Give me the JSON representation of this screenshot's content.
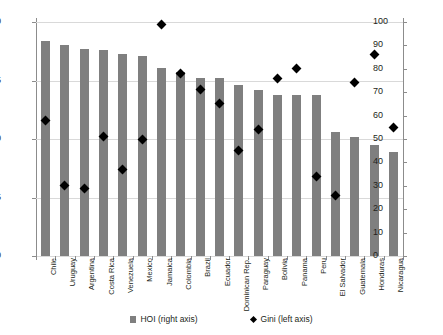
{
  "chart_data": {
    "type": "bar",
    "title": "",
    "xlabel": "",
    "ylabel": "",
    "categories": [
      "Chile",
      "Uruguay",
      "Argentina",
      "Costa Rica",
      "Venezuela",
      "Mexico",
      "Jamaica",
      "Colombia",
      "Brazil",
      "Ecuador",
      "Dominican Rep.",
      "Paraguay",
      "Bolivia",
      "Panama",
      "Peru",
      "El Salvador",
      "Guatemala",
      "Honduras",
      "Nicaragua"
    ],
    "series": [
      {
        "name": "HOI (right axis)",
        "type": "bar",
        "axis": "left",
        "color": "#7f7f7f",
        "marker": "bar",
        "values": [
          0.584,
          0.58,
          0.577,
          0.576,
          0.573,
          0.571,
          0.561,
          0.557,
          0.552,
          0.552,
          0.546,
          0.542,
          0.538,
          0.538,
          0.538,
          0.506,
          0.502,
          0.495,
          0.489
        ]
      },
      {
        "name": "Gini (left axis)",
        "type": "scatter",
        "axis": "right",
        "color": "#000000",
        "marker": "diamond",
        "values": [
          58,
          30,
          29,
          51,
          37,
          50,
          99,
          78,
          71,
          65,
          45,
          54,
          76,
          80,
          34,
          26,
          74,
          86,
          55
        ]
      }
    ],
    "left_axis": {
      "label": "",
      "ticks": [
        "0.40",
        "0.45",
        "0.50",
        "0.55",
        "0.60"
      ],
      "tick_values": [
        0.4,
        0.45,
        0.5,
        0.55,
        0.6
      ],
      "min": 0.4,
      "max": 0.6
    },
    "right_axis": {
      "label": "",
      "ticks": [
        "0",
        "10",
        "20",
        "30",
        "40",
        "50",
        "60",
        "70",
        "80",
        "90",
        "100"
      ],
      "tick_values": [
        0,
        10,
        20,
        30,
        40,
        50,
        60,
        70,
        80,
        90,
        100
      ],
      "min": 0,
      "max": 100
    },
    "grid": true,
    "legend_position": "bottom",
    "legend": [
      {
        "label": "HOI (right axis)",
        "marker": "bar-swatch-icon"
      },
      {
        "label": "Gini (left axis)",
        "marker": "diamond-swatch-icon"
      }
    ],
    "colors": {
      "bar": "#7f7f7f",
      "point": "#000000",
      "grid": "#d9d9d9",
      "axis": "#8c8c8c",
      "text": "#231f20",
      "background": "#ffffff"
    }
  }
}
